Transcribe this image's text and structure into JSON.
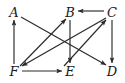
{
  "figure": {
    "type": "directed-graph-diagram",
    "background_color": "#ffffff",
    "stroke_color": "#2b2b2b",
    "label_color": "#1a1a1a",
    "width": 125,
    "height": 83
  },
  "nodes": [
    {
      "id": "A",
      "label": "A",
      "x": 14,
      "y": 12
    },
    {
      "id": "B",
      "label": "B",
      "x": 70,
      "y": 12
    },
    {
      "id": "C",
      "label": "C",
      "x": 112,
      "y": 12
    },
    {
      "id": "F",
      "label": "F",
      "x": 14,
      "y": 71
    },
    {
      "id": "E",
      "label": "E",
      "x": 70,
      "y": 71
    },
    {
      "id": "D",
      "label": "D",
      "x": 112,
      "y": 71
    }
  ],
  "edges": [
    {
      "id": "F-A",
      "from": "F",
      "to": "A",
      "x1": 14,
      "y1": 64,
      "x2": 14,
      "y2": 20
    },
    {
      "id": "C-B",
      "from": "C",
      "to": "B",
      "x1": 104,
      "y1": 11,
      "x2": 78,
      "y2": 11
    },
    {
      "id": "C-D",
      "from": "C",
      "to": "D",
      "x1": 112,
      "y1": 20,
      "x2": 112,
      "y2": 63
    },
    {
      "id": "B-E",
      "from": "B",
      "to": "E",
      "x1": 70,
      "y1": 20,
      "x2": 70,
      "y2": 63
    },
    {
      "id": "F-E",
      "from": "F",
      "to": "E",
      "x1": 22,
      "y1": 71,
      "x2": 62,
      "y2": 71
    },
    {
      "id": "A-D",
      "from": "A",
      "to": "D",
      "x1": 21,
      "y1": 17,
      "x2": 106,
      "y2": 65
    },
    {
      "id": "C-F",
      "from": "C",
      "to": "F",
      "x1": 106,
      "y1": 18,
      "x2": 22,
      "y2": 66
    },
    {
      "id": "F-B",
      "from": "F",
      "to": "B",
      "x1": 20,
      "y1": 66,
      "x2": 66,
      "y2": 19
    },
    {
      "id": "E-C",
      "from": "E",
      "to": "C",
      "x1": 64,
      "y1": 66,
      "x2": 106,
      "y2": 20
    }
  ]
}
